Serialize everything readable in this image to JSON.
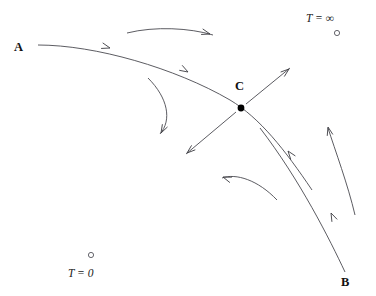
{
  "diagram": {
    "background_color": "#ffffff",
    "stroke_color": "#4a4a50",
    "labels": {
      "a": "A",
      "b": "B",
      "c": "C",
      "t_zero": "T = 0",
      "t_infinity": "T = ∞"
    },
    "nodes": [
      {
        "name": "fixed-point-c",
        "kind": "filled",
        "x": 241,
        "y": 108,
        "r": 3.4
      },
      {
        "name": "fixed-point-t-zero",
        "kind": "open",
        "x": 91,
        "y": 255,
        "r": 2.6
      },
      {
        "name": "fixed-point-t-infinity",
        "kind": "open",
        "x": 337,
        "y": 33,
        "r": 2.6
      }
    ],
    "label_positions": {
      "a": {
        "x": 14,
        "y": 51
      },
      "b": {
        "x": 341,
        "y": 286
      },
      "c": {
        "x": 235,
        "y": 90
      },
      "t_zero": {
        "x": 68,
        "y": 277
      },
      "t_infinity": {
        "x": 306,
        "y": 22
      }
    },
    "flow_curves": [
      {
        "name": "separatrix-a-to-c",
        "path": "M 38,45 C 95,45 175,68 230,100 C 260,118 285,150 312,190",
        "arrows": [
          {
            "x": 110,
            "y": 48,
            "angle": 16
          },
          {
            "x": 188,
            "y": 72,
            "angle": 30
          }
        ]
      },
      {
        "name": "top-incoming-arc",
        "path": "M 127,33 C 155,26 190,28 213,35",
        "arrows": [
          {
            "x": 210,
            "y": 34,
            "angle": 16
          }
        ]
      },
      {
        "name": "left-outgoing-arc",
        "path": "M 148,78 C 168,98 172,120 160,134",
        "arrows": [
          {
            "x": 161,
            "y": 133,
            "angle": 118
          }
        ]
      },
      {
        "name": "unstable-out-lower-left",
        "path": "M 236,112 L 186,154",
        "arrows": [
          {
            "x": 187,
            "y": 153,
            "angle": 140
          }
        ]
      },
      {
        "name": "unstable-out-upper-right",
        "path": "M 246,104 L 290,68",
        "arrows": [
          {
            "x": 289,
            "y": 69,
            "angle": -39
          }
        ]
      },
      {
        "name": "lower-incoming-arc",
        "path": "M 277,200 C 258,180 236,173 222,178",
        "arrows": [
          {
            "x": 223,
            "y": 177,
            "angle": 200
          }
        ]
      },
      {
        "name": "separatrix-b-to-c",
        "path": "M 345,272 C 330,240 300,180 260,128",
        "arrows": [
          {
            "x": 331,
            "y": 213,
            "angle": 245
          },
          {
            "x": 288,
            "y": 151,
            "angle": 233
          }
        ]
      },
      {
        "name": "right-outgoing-arc",
        "path": "M 355,215 C 348,185 335,150 328,128",
        "arrows": [
          {
            "x": 328,
            "y": 127,
            "angle": 256
          }
        ]
      }
    ]
  }
}
